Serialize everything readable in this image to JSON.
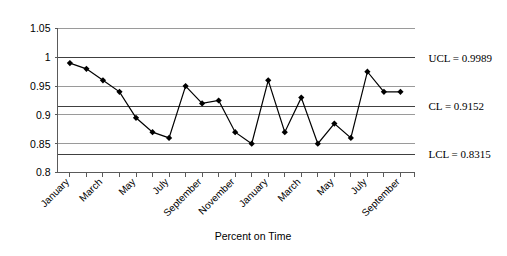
{
  "chart_data": {
    "type": "line",
    "title": "",
    "xlabel": "Percent on Time",
    "ylabel": "",
    "ylim": [
      0.8,
      1.05
    ],
    "ytick_labels": [
      "1.05",
      "1",
      "0.95",
      "0.9",
      "0.85",
      "0.8"
    ],
    "ytick_values": [
      1.05,
      1.0,
      0.95,
      0.9,
      0.85,
      0.8
    ],
    "grid": true,
    "legend": "none",
    "x": [
      1,
      2,
      3,
      4,
      5,
      6,
      7,
      8,
      9,
      10,
      11,
      12,
      13,
      14,
      15,
      16,
      17,
      18,
      19,
      20,
      21
    ],
    "xtick_labels": [
      "January",
      "",
      "March",
      "",
      "May",
      "",
      "July",
      "",
      "September",
      "",
      "November",
      "",
      "January",
      "",
      "March",
      "",
      "May",
      "",
      "July",
      "",
      "September"
    ],
    "categories": [
      "January",
      "February",
      "March",
      "April",
      "May",
      "June",
      "July",
      "August",
      "September",
      "October",
      "November",
      "December",
      "January",
      "February",
      "March",
      "April",
      "May",
      "June",
      "July",
      "August",
      "September"
    ],
    "series": [
      {
        "name": "Percent on Time",
        "values": [
          0.99,
          0.98,
          0.96,
          0.94,
          0.895,
          0.87,
          0.86,
          0.95,
          0.92,
          0.925,
          0.87,
          0.85,
          0.96,
          0.87,
          0.93,
          0.85,
          0.885,
          0.86,
          0.975,
          0.94,
          0.94
        ],
        "marker": "diamond",
        "color": "#000000"
      }
    ],
    "control_limits": [
      {
        "key": "UCL",
        "label": "UCL = 0.9989",
        "value": 0.9989
      },
      {
        "key": "CL",
        "label": "CL = 0.9152",
        "value": 0.9152
      },
      {
        "key": "LCL",
        "label": "LCL = 0.8315",
        "value": 0.8315
      }
    ]
  }
}
